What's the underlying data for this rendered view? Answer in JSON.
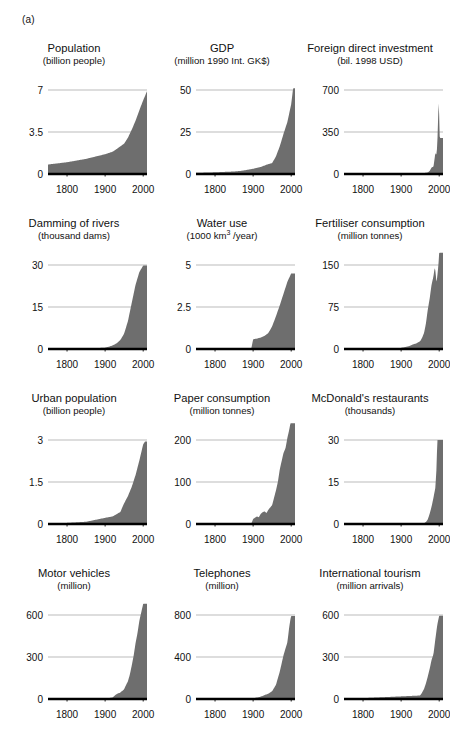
{
  "figure": {
    "panel_label": "(a)",
    "series_color": "#6e6e6e",
    "axis_color": "#000000",
    "grid_color": "#b3b3b3",
    "background": "#ffffff"
  },
  "chart_data": [
    {
      "type": "area",
      "title": "Population",
      "subtitle": "(billion people)",
      "ylabel": "billion people",
      "xlabel": "",
      "ylim": [
        0,
        7
      ],
      "yticks": [
        0,
        3.5,
        7
      ],
      "ytick_labels": [
        "0",
        "3.5",
        "7"
      ],
      "xlim": [
        1750,
        2010
      ],
      "xticks": [
        1800,
        1900,
        2000
      ],
      "xtick_labels": [
        "1800",
        "1900",
        "2000"
      ],
      "grid": true,
      "x": [
        1750,
        1800,
        1850,
        1900,
        1920,
        1940,
        1950,
        1960,
        1970,
        1980,
        1990,
        2000,
        2010
      ],
      "values": [
        0.79,
        0.98,
        1.26,
        1.65,
        1.86,
        2.3,
        2.53,
        3.03,
        3.7,
        4.44,
        5.32,
        6.14,
        6.9
      ]
    },
    {
      "type": "area",
      "title": "GDP",
      "subtitle": "(million 1990 Int. GK$)",
      "ylabel": "million 1990 Int. GK$",
      "xlabel": "",
      "ylim": [
        0,
        50
      ],
      "yticks": [
        0,
        25,
        50
      ],
      "ytick_labels": [
        "0",
        "25",
        "50"
      ],
      "xlim": [
        1750,
        2010
      ],
      "xticks": [
        1800,
        1900,
        2000
      ],
      "xtick_labels": [
        "1800",
        "1900",
        "2000"
      ],
      "grid": true,
      "x": [
        1750,
        1800,
        1850,
        1870,
        1900,
        1920,
        1940,
        1950,
        1960,
        1970,
        1980,
        1990,
        2000,
        2005
      ],
      "values": [
        0.7,
        1.0,
        1.5,
        1.9,
        3.1,
        4.2,
        5.9,
        6.5,
        10.5,
        16.5,
        24.0,
        31.0,
        41.5,
        51.0
      ]
    },
    {
      "type": "area",
      "title": "Foreign direct investment",
      "subtitle": "(bil. 1998 USD)",
      "ylabel": "bil. 1998 USD",
      "xlabel": "",
      "ylim": [
        0,
        700
      ],
      "yticks": [
        0,
        350,
        700
      ],
      "ytick_labels": [
        "0",
        "350",
        "700"
      ],
      "xlim": [
        1750,
        2010
      ],
      "xticks": [
        1800,
        1900,
        2000
      ],
      "xtick_labels": [
        "1800",
        "1900",
        "2000"
      ],
      "grid": true,
      "x": [
        1750,
        1900,
        1950,
        1960,
        1970,
        1975,
        1980,
        1985,
        1988,
        1990,
        1992,
        1994,
        1996,
        1998,
        1999,
        2000,
        2001,
        2002
      ],
      "values": [
        0,
        0,
        5,
        8,
        13,
        25,
        55,
        60,
        130,
        180,
        150,
        200,
        330,
        560,
        620,
        480,
        320,
        300
      ]
    },
    {
      "type": "area",
      "title": "Damming of rivers",
      "subtitle": "(thousand dams)",
      "ylabel": "thousand dams",
      "xlabel": "",
      "ylim": [
        0,
        30
      ],
      "yticks": [
        0,
        15,
        30
      ],
      "ytick_labels": [
        "0",
        "15",
        "30"
      ],
      "xlim": [
        1750,
        2010
      ],
      "xticks": [
        1800,
        1900,
        2000
      ],
      "xtick_labels": [
        "1800",
        "1900",
        "2000"
      ],
      "grid": true,
      "x": [
        1750,
        1850,
        1900,
        1910,
        1920,
        1930,
        1940,
        1950,
        1960,
        1970,
        1980,
        1990,
        2000
      ],
      "values": [
        0,
        0.1,
        0.5,
        0.8,
        1.3,
        2.0,
        3.2,
        5.5,
        10.0,
        16.5,
        23.0,
        27.5,
        29.8
      ]
    },
    {
      "type": "area",
      "title": "Water use",
      "subtitle": "(1000 km3 /year)",
      "subtitle_prefix": "(1000 km",
      "subtitle_sup": "3",
      "subtitle_suffix": " /year)",
      "ylabel": "1000 km3 /year",
      "xlabel": "",
      "ylim": [
        0,
        5
      ],
      "yticks": [
        0,
        2.5,
        5
      ],
      "ytick_labels": [
        "0",
        "2.5",
        "5"
      ],
      "xlim": [
        1750,
        2010
      ],
      "xticks": [
        1800,
        1900,
        2000
      ],
      "xtick_labels": [
        "1800",
        "1900",
        "2000"
      ],
      "grid": true,
      "x": [
        1750,
        1895,
        1900,
        1910,
        1920,
        1930,
        1940,
        1950,
        1960,
        1970,
        1980,
        1990,
        2000
      ],
      "values": [
        0,
        0,
        0.58,
        0.62,
        0.68,
        0.78,
        0.95,
        1.35,
        1.95,
        2.6,
        3.3,
        4.0,
        4.5
      ]
    },
    {
      "type": "area",
      "title": "Fertiliser consumption",
      "subtitle": "(million tonnes)",
      "ylabel": "million tonnes",
      "xlabel": "",
      "ylim": [
        0,
        150
      ],
      "yticks": [
        0,
        75,
        150
      ],
      "ytick_labels": [
        "0",
        "75",
        "150"
      ],
      "xlim": [
        1750,
        2010
      ],
      "xticks": [
        1800,
        1900,
        2000
      ],
      "xtick_labels": [
        "1800",
        "1900",
        "2000"
      ],
      "grid": true,
      "x": [
        1750,
        1900,
        1920,
        1930,
        1940,
        1950,
        1955,
        1960,
        1965,
        1970,
        1975,
        1980,
        1985,
        1988,
        1990,
        1993,
        1995,
        1998,
        2000
      ],
      "values": [
        0,
        2,
        5,
        8,
        10,
        14,
        20,
        28,
        45,
        70,
        90,
        115,
        130,
        145,
        140,
        118,
        130,
        150,
        172
      ]
    },
    {
      "type": "area",
      "title": "Urban population",
      "subtitle": "(billion people)",
      "ylabel": "billion people",
      "xlabel": "",
      "ylim": [
        0,
        3
      ],
      "yticks": [
        0,
        1.5,
        3
      ],
      "ytick_labels": [
        "0",
        "1.5",
        "3"
      ],
      "xlim": [
        1750,
        2010
      ],
      "xticks": [
        1800,
        1900,
        2000
      ],
      "xtick_labels": [
        "1800",
        "1900",
        "2000"
      ],
      "grid": true,
      "x": [
        1750,
        1800,
        1850,
        1900,
        1920,
        1940,
        1950,
        1960,
        1970,
        1980,
        1990,
        2000,
        2005
      ],
      "values": [
        0.02,
        0.04,
        0.08,
        0.22,
        0.27,
        0.43,
        0.74,
        1.0,
        1.33,
        1.75,
        2.27,
        2.85,
        2.95
      ]
    },
    {
      "type": "area",
      "title": "Paper consumption",
      "subtitle": "(million tonnes)",
      "ylabel": "million tonnes",
      "xlabel": "",
      "ylim": [
        0,
        200
      ],
      "yticks": [
        0,
        100,
        200
      ],
      "ytick_labels": [
        "0",
        "100",
        "200"
      ],
      "xlim": [
        1750,
        2010
      ],
      "xticks": [
        1800,
        1900,
        2000
      ],
      "xtick_labels": [
        "1800",
        "1900",
        "2000"
      ],
      "grid": true,
      "x": [
        1750,
        1895,
        1900,
        1910,
        1915,
        1920,
        1925,
        1930,
        1935,
        1940,
        1950,
        1960,
        1965,
        1970,
        1975,
        1980,
        1985,
        1990,
        1995,
        1998
      ],
      "values": [
        0,
        0,
        12,
        18,
        16,
        24,
        28,
        30,
        26,
        34,
        45,
        80,
        100,
        130,
        150,
        170,
        180,
        205,
        225,
        240
      ]
    },
    {
      "type": "area",
      "title": "McDonald's restaurants",
      "subtitle": "(thousands)",
      "ylabel": "thousands",
      "xlabel": "",
      "ylim": [
        0,
        30
      ],
      "yticks": [
        0,
        15,
        30
      ],
      "ytick_labels": [
        "0",
        "15",
        "30"
      ],
      "xlim": [
        1750,
        2010
      ],
      "xticks": [
        1800,
        1900,
        2000
      ],
      "xtick_labels": [
        "1800",
        "1900",
        "2000"
      ],
      "grid": true,
      "x": [
        1750,
        1950,
        1955,
        1960,
        1965,
        1970,
        1975,
        1980,
        1985,
        1990,
        1993,
        1995
      ],
      "values": [
        0,
        0,
        0.1,
        0.25,
        0.7,
        1.6,
        3.7,
        6.2,
        9.4,
        13.0,
        20.0,
        30.0
      ]
    },
    {
      "type": "area",
      "title": "Motor vehicles",
      "subtitle": "(million)",
      "ylabel": "million",
      "xlabel": "",
      "ylim": [
        0,
        600
      ],
      "yticks": [
        0,
        300,
        600
      ],
      "ytick_labels": [
        "0",
        "300",
        "600"
      ],
      "xlim": [
        1750,
        2010
      ],
      "xticks": [
        1800,
        1900,
        2000
      ],
      "xtick_labels": [
        "1800",
        "1900",
        "2000"
      ],
      "grid": true,
      "x": [
        1750,
        1900,
        1920,
        1930,
        1940,
        1950,
        1955,
        1960,
        1965,
        1970,
        1975,
        1980,
        1985,
        1990,
        1995,
        2000
      ],
      "values": [
        0,
        0.5,
        12,
        35,
        46,
        70,
        100,
        127,
        175,
        240,
        310,
        400,
        470,
        560,
        620,
        680
      ]
    },
    {
      "type": "area",
      "title": "Telephones",
      "subtitle": "(million)",
      "ylabel": "million",
      "xlabel": "",
      "ylim": [
        0,
        800
      ],
      "yticks": [
        0,
        400,
        800
      ],
      "ytick_labels": [
        "0",
        "400",
        "800"
      ],
      "xlim": [
        1750,
        2010
      ],
      "xticks": [
        1800,
        1900,
        2000
      ],
      "xtick_labels": [
        "1800",
        "1900",
        "2000"
      ],
      "grid": true,
      "x": [
        1750,
        1890,
        1900,
        1920,
        1930,
        1940,
        1950,
        1960,
        1970,
        1980,
        1985,
        1990,
        1995,
        1998,
        2000
      ],
      "values": [
        0,
        2,
        6,
        22,
        38,
        50,
        75,
        135,
        260,
        420,
        480,
        540,
        690,
        760,
        790
      ]
    },
    {
      "type": "area",
      "title": "International tourism",
      "subtitle": "(million arrivals)",
      "ylabel": "million arrivals",
      "xlabel": "",
      "ylim": [
        0,
        600
      ],
      "yticks": [
        0,
        300,
        600
      ],
      "ytick_labels": [
        "0",
        "300",
        "600"
      ],
      "xlim": [
        1750,
        2010
      ],
      "xticks": [
        1800,
        1900,
        2000
      ],
      "xtick_labels": [
        "1800",
        "1900",
        "2000"
      ],
      "grid": true,
      "x": [
        1750,
        1950,
        1955,
        1960,
        1965,
        1970,
        1975,
        1980,
        1985,
        1990,
        1995,
        1998,
        2000
      ],
      "values": [
        0,
        25,
        45,
        70,
        110,
        160,
        215,
        280,
        320,
        430,
        530,
        570,
        595
      ]
    }
  ]
}
